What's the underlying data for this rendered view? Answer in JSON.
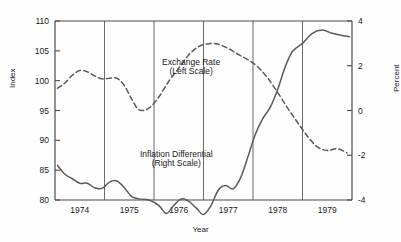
{
  "chart_data": {
    "type": "line",
    "title": "",
    "xlabel": "Year",
    "ylabel": "Index",
    "ylabel_right": "Percent",
    "xlim": [
      1973.5,
      1979.5
    ],
    "ylim": [
      80,
      110
    ],
    "ylim_right": [
      -4,
      4
    ],
    "grid": "vertical year boundaries only",
    "legend_position": "inline annotations",
    "xticks": [
      "1974",
      "1975",
      "1976",
      "1977",
      "1978",
      "1979"
    ],
    "xtick_positions": [
      1974,
      1975,
      1976,
      1977,
      1978,
      1979
    ],
    "yticks_left": [
      80,
      85,
      90,
      95,
      100,
      105,
      110
    ],
    "yticks_right": [
      -4,
      -2,
      0,
      2,
      4
    ],
    "gridline_x": [
      1974.5,
      1975.5,
      1976.5,
      1977.5,
      1978.5
    ],
    "annotations": [
      {
        "text": "Exchange Rate",
        "x": 1976.25,
        "y": 102.6
      },
      {
        "text": "(Left Scale)",
        "x": 1976.25,
        "y": 101.1
      },
      {
        "text": "Inflation Differential",
        "x": 1975.95,
        "y": 87.2
      },
      {
        "text": "(Right Scale)",
        "x": 1975.95,
        "y": 85.7
      }
    ],
    "series": [
      {
        "name": "Exchange Rate",
        "scale": "left",
        "style": "dashed",
        "color": "#5a5a5a",
        "x": [
          1973.55,
          1973.7,
          1973.85,
          1974.0,
          1974.15,
          1974.3,
          1974.45,
          1974.6,
          1974.75,
          1974.9,
          1975.05,
          1975.2,
          1975.4,
          1975.6,
          1975.8,
          1976.0,
          1976.2,
          1976.4,
          1976.6,
          1976.8,
          1977.0,
          1977.2,
          1977.4,
          1977.6,
          1977.8,
          1978.0,
          1978.2,
          1978.4,
          1978.6,
          1978.8,
          1979.0,
          1979.2,
          1979.4
        ],
        "values": [
          98.7,
          99.6,
          100.9,
          101.7,
          101.5,
          100.8,
          100.3,
          100.4,
          100.4,
          99.2,
          96.9,
          95.1,
          95.4,
          97.3,
          99.9,
          102.1,
          104.3,
          105.7,
          106.2,
          106.1,
          105.4,
          104.4,
          103.5,
          102.3,
          100.4,
          98.0,
          95.4,
          93.0,
          90.7,
          88.9,
          88.3,
          88.6,
          87.9
        ]
      },
      {
        "name": "Inflation Differential",
        "scale": "right",
        "style": "solid",
        "color": "#5a5a5a",
        "x": [
          1973.55,
          1973.7,
          1973.85,
          1974.0,
          1974.15,
          1974.3,
          1974.45,
          1974.6,
          1974.75,
          1974.9,
          1975.05,
          1975.2,
          1975.4,
          1975.6,
          1975.75,
          1975.9,
          1976.05,
          1976.2,
          1976.35,
          1976.5,
          1976.65,
          1976.8,
          1976.95,
          1977.1,
          1977.25,
          1977.4,
          1977.55,
          1977.7,
          1977.85,
          1978.0,
          1978.15,
          1978.3,
          1978.5,
          1978.7,
          1978.9,
          1979.1,
          1979.3,
          1979.45
        ],
        "values": [
          -2.45,
          -2.85,
          -3.05,
          -3.25,
          -3.25,
          -3.45,
          -3.48,
          -3.2,
          -3.15,
          -3.45,
          -3.85,
          -3.95,
          -4.0,
          -4.25,
          -4.6,
          -4.25,
          -3.95,
          -4.05,
          -4.35,
          -4.65,
          -4.25,
          -3.55,
          -3.35,
          -3.5,
          -3.0,
          -2.05,
          -1.05,
          -0.35,
          0.15,
          0.95,
          1.95,
          2.65,
          3.0,
          3.45,
          3.6,
          3.45,
          3.35,
          3.3
        ]
      }
    ],
    "series_left_equivalent_note": "Inflation differential drawn on right percent axis; exchange rate on left index axis"
  },
  "axes": {
    "left_title": "Index",
    "right_title": "Percent",
    "bottom_title": "Year"
  },
  "style": {
    "line_color": "#5a5a5a",
    "axis_color": "#4a4a4a",
    "grid_color": "#5a5a5a",
    "text_color": "#1a1a1a",
    "background": "#fefefe"
  }
}
